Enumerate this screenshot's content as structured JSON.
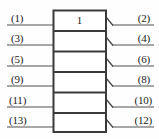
{
  "diagram": {
    "type": "block-connector-diagram",
    "block": {
      "label": "1",
      "cell_count": 6,
      "geometry": {
        "x": 53,
        "y": 10,
        "width": 53,
        "height": 122,
        "row_height": 20.33
      },
      "stroke_color": "#3a3a3a",
      "fill_color": "#ffffff"
    },
    "background_color": "#fefefe",
    "line_color": "#8a8a8a",
    "text_color": "#1a1a1a",
    "left_pins": [
      {
        "label": "(1)",
        "row": 1,
        "line_y": 25
      },
      {
        "label": "(3)",
        "row": 2,
        "line_y": 45
      },
      {
        "label": "(5)",
        "row": 3,
        "line_y": 66
      },
      {
        "label": "(9)",
        "row": 4,
        "line_y": 86
      },
      {
        "label": "(11)",
        "row": 5,
        "line_y": 107
      },
      {
        "label": "(13)",
        "row": 6,
        "line_y": 127
      }
    ],
    "right_pins": [
      {
        "label": "(2)",
        "row": 1,
        "line_y": 25
      },
      {
        "label": "(4)",
        "row": 2,
        "line_y": 45
      },
      {
        "label": "(6)",
        "row": 3,
        "line_y": 66
      },
      {
        "label": "(8)",
        "row": 4,
        "line_y": 86
      },
      {
        "label": "(10)",
        "row": 5,
        "line_y": 107
      },
      {
        "label": "(12)",
        "row": 6,
        "line_y": 127
      }
    ],
    "arrow_marks": {
      "name": "diagonal-connector-arrow",
      "count": 6,
      "side": "right"
    }
  }
}
